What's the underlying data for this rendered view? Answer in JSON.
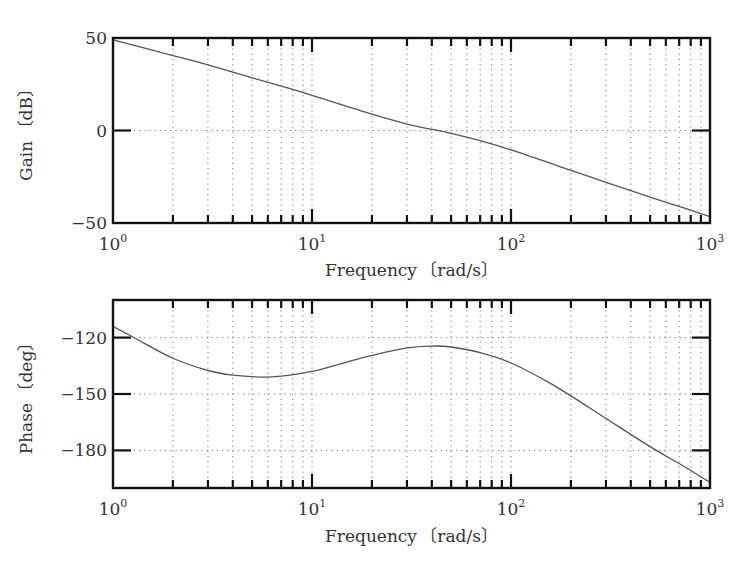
{
  "chart_data": [
    {
      "type": "line",
      "title": "",
      "xlabel": "Frequency 〔rad/s〕",
      "ylabel": "Gain 〔dB〕",
      "xscale": "log",
      "xlim": [
        1,
        1000
      ],
      "ylim": [
        -50,
        50
      ],
      "grid": true,
      "xticks": [
        {
          "value": 1,
          "base": "10",
          "exp": "0"
        },
        {
          "value": 10,
          "base": "10",
          "exp": "1"
        },
        {
          "value": 100,
          "base": "10",
          "exp": "2"
        },
        {
          "value": 1000,
          "base": "10",
          "exp": "3"
        }
      ],
      "yticks": [
        {
          "value": 50,
          "label": "50"
        },
        {
          "value": 0,
          "label": "0"
        },
        {
          "value": -50,
          "label": "−50"
        }
      ],
      "series": [
        {
          "name": "gain",
          "x": [
            1,
            2,
            3,
            5,
            7,
            10,
            20,
            30,
            50,
            70,
            100,
            200,
            300,
            500,
            700,
            1000
          ],
          "y": [
            49,
            40.5,
            35.5,
            28.5,
            24,
            19,
            8.8,
            3.5,
            -1.5,
            -5.5,
            -10.5,
            -21.5,
            -28,
            -36,
            -41,
            -46.5
          ]
        }
      ]
    },
    {
      "type": "line",
      "title": "",
      "xlabel": "Frequency 〔rad/s〕",
      "ylabel": "Phase 〔deg〕",
      "xscale": "log",
      "xlim": [
        1,
        1000
      ],
      "ylim": [
        -200,
        -100
      ],
      "grid": true,
      "xticks": [
        {
          "value": 1,
          "base": "10",
          "exp": "0"
        },
        {
          "value": 10,
          "base": "10",
          "exp": "1"
        },
        {
          "value": 100,
          "base": "10",
          "exp": "2"
        },
        {
          "value": 1000,
          "base": "10",
          "exp": "3"
        }
      ],
      "yticks": [
        {
          "value": -120,
          "label": "−120"
        },
        {
          "value": -150,
          "label": "−150"
        },
        {
          "value": -180,
          "label": "−180"
        }
      ],
      "series": [
        {
          "name": "phase",
          "x": [
            1,
            1.3,
            2,
            3,
            4,
            5.5,
            7,
            10,
            15,
            20,
            30,
            40,
            50,
            70,
            100,
            150,
            200,
            300,
            500,
            700,
            1000
          ],
          "y": [
            -114,
            -120.5,
            -131,
            -137.5,
            -140,
            -141,
            -140.5,
            -138,
            -133,
            -129.5,
            -125.5,
            -124.5,
            -125,
            -128,
            -133.5,
            -143,
            -151,
            -163,
            -178,
            -187,
            -197
          ]
        }
      ]
    }
  ]
}
